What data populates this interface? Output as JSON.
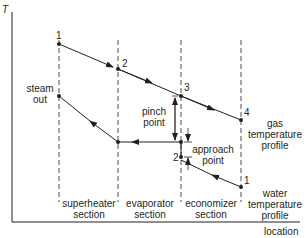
{
  "diagram": {
    "axes": {
      "y_label": "T",
      "x_label": "location"
    },
    "sections": [
      {
        "line1": "superheater",
        "line2": "section"
      },
      {
        "line1": "evaporator",
        "line2": "section"
      },
      {
        "line1": "economizer",
        "line2": "section"
      }
    ],
    "gas_profile": {
      "label_line1": "gas",
      "label_line2": "temperature",
      "label_line3": "profile",
      "points": [
        "1",
        "2",
        "3",
        "4"
      ]
    },
    "water_profile": {
      "label_line1": "water",
      "label_line2": "temperature",
      "label_line3": "profile",
      "points": [
        "1",
        "2"
      ],
      "steam_out_line1": "steam",
      "steam_out_line2": "out"
    },
    "annotations": {
      "pinch_line1": "pinch",
      "pinch_line2": "point",
      "approach_line1": "approach",
      "approach_line2": "point"
    },
    "colors": {
      "line": "#231f20",
      "dashed": "#231f20",
      "background": "#ffffff"
    }
  }
}
